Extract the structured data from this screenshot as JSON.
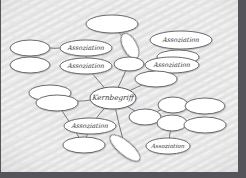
{
  "canvas": {
    "width": 246,
    "height": 178,
    "background_color": "#e9e9e9",
    "texture": "diagonal-wavy-paper",
    "border_color": "#55545a",
    "node_fill": "#ffffff",
    "node_stroke": "#5a5a5f",
    "edge_color": "#6a6a70",
    "text_color": "#3b3b3b"
  },
  "diagram": {
    "type": "mind-map",
    "center": {
      "id": "core",
      "label": "Kernbegriff",
      "cx": 113,
      "cy": 98,
      "rx": 23,
      "ry": 11,
      "rotate": 0,
      "font_size": 7.2
    },
    "nodes": [
      {
        "id": "n01",
        "label": "",
        "cx": 112,
        "cy": 24,
        "rx": 26,
        "ry": 9,
        "rotate": 0,
        "font_size": 6
      },
      {
        "id": "n02",
        "label": "",
        "cx": 130,
        "cy": 46,
        "rx": 14,
        "ry": 7,
        "rotate": 62,
        "font_size": 6
      },
      {
        "id": "n03",
        "label": "Assoziation",
        "cx": 86,
        "cy": 48,
        "rx": 26,
        "ry": 8,
        "rotate": 0,
        "font_size": 6.4
      },
      {
        "id": "n04",
        "label": "Assoziation",
        "cx": 86,
        "cy": 66,
        "rx": 26,
        "ry": 8,
        "rotate": 0,
        "font_size": 6.4
      },
      {
        "id": "n05",
        "label": "",
        "cx": 30,
        "cy": 48,
        "rx": 20,
        "ry": 8,
        "rotate": 0,
        "font_size": 6
      },
      {
        "id": "n06",
        "label": "",
        "cx": 30,
        "cy": 65,
        "rx": 20,
        "ry": 8,
        "rotate": 0,
        "font_size": 6
      },
      {
        "id": "n07",
        "label": "Assoziation",
        "cx": 181,
        "cy": 40,
        "rx": 31,
        "ry": 9,
        "rotate": 0,
        "font_size": 6.4
      },
      {
        "id": "n08",
        "label": "",
        "cx": 178,
        "cy": 57,
        "rx": 21,
        "ry": 7,
        "rotate": 0,
        "font_size": 6
      },
      {
        "id": "n09",
        "label": "Assoziation",
        "cx": 172,
        "cy": 65,
        "rx": 27,
        "ry": 8,
        "rotate": 0,
        "font_size": 6.4
      },
      {
        "id": "n10",
        "label": "",
        "cx": 129,
        "cy": 64,
        "rx": 15,
        "ry": 7,
        "rotate": 0,
        "font_size": 6
      },
      {
        "id": "n11",
        "label": "",
        "cx": 156,
        "cy": 79,
        "rx": 21,
        "ry": 8,
        "rotate": 0,
        "font_size": 6
      },
      {
        "id": "n12",
        "label": "",
        "cx": 50,
        "cy": 93,
        "rx": 21,
        "ry": 8,
        "rotate": 0,
        "font_size": 6
      },
      {
        "id": "n13",
        "label": "",
        "cx": 57,
        "cy": 103,
        "rx": 21,
        "ry": 8,
        "rotate": 0,
        "font_size": 6
      },
      {
        "id": "n14",
        "label": "Assoziation",
        "cx": 90,
        "cy": 126,
        "rx": 26,
        "ry": 8,
        "rotate": 0,
        "font_size": 6.4
      },
      {
        "id": "n15",
        "label": "",
        "cx": 84,
        "cy": 145,
        "rx": 21,
        "ry": 8,
        "rotate": 0,
        "font_size": 6
      },
      {
        "id": "n16",
        "label": "",
        "cx": 173,
        "cy": 105,
        "rx": 15,
        "ry": 8,
        "rotate": 0,
        "font_size": 6
      },
      {
        "id": "n17",
        "label": "",
        "cx": 205,
        "cy": 106,
        "rx": 20,
        "ry": 8,
        "rotate": 0,
        "font_size": 6
      },
      {
        "id": "n18",
        "label": "",
        "cx": 145,
        "cy": 117,
        "rx": 16,
        "ry": 8,
        "rotate": 0,
        "font_size": 6
      },
      {
        "id": "n19",
        "label": "",
        "cx": 172,
        "cy": 123,
        "rx": 15,
        "ry": 8,
        "rotate": 0,
        "font_size": 6
      },
      {
        "id": "n20",
        "label": "",
        "cx": 205,
        "cy": 125,
        "rx": 21,
        "ry": 8,
        "rotate": 0,
        "font_size": 6
      },
      {
        "id": "n21",
        "label": "Assoziation",
        "cx": 168,
        "cy": 146,
        "rx": 22,
        "ry": 8,
        "rotate": 0,
        "font_size": 5.8
      },
      {
        "id": "n22",
        "label": "",
        "cx": 125,
        "cy": 148,
        "rx": 19,
        "ry": 7,
        "rotate": 40,
        "font_size": 6
      }
    ],
    "edges": [
      {
        "from": "core",
        "to": "n04"
      },
      {
        "from": "core",
        "to": "n10"
      },
      {
        "from": "core",
        "to": "n11"
      },
      {
        "from": "core",
        "to": "n13"
      },
      {
        "from": "core",
        "to": "n14"
      },
      {
        "from": "core",
        "to": "n18"
      },
      {
        "from": "core",
        "to": "n22"
      },
      {
        "from": "n03",
        "to": "n05"
      },
      {
        "from": "n03",
        "to": "n04"
      },
      {
        "from": "n05",
        "to": "n06"
      },
      {
        "from": "n10",
        "to": "n02"
      },
      {
        "from": "n02",
        "to": "n01"
      },
      {
        "from": "n07",
        "to": "n08"
      },
      {
        "from": "n08",
        "to": "n09"
      },
      {
        "from": "n09",
        "to": "n11"
      },
      {
        "from": "n12",
        "to": "n13"
      },
      {
        "from": "n14",
        "to": "n15"
      },
      {
        "from": "n16",
        "to": "n17"
      },
      {
        "from": "n18",
        "to": "n16"
      },
      {
        "from": "n18",
        "to": "n19"
      },
      {
        "from": "n19",
        "to": "n20"
      },
      {
        "from": "n19",
        "to": "n21"
      },
      {
        "from": "n13",
        "to": "n15"
      }
    ]
  }
}
